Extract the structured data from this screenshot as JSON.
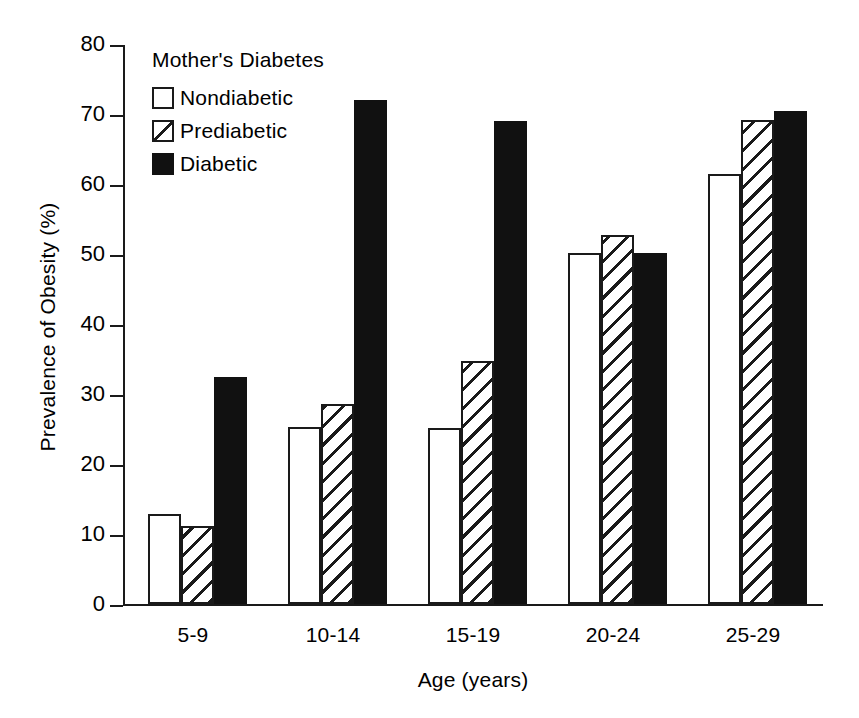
{
  "chart_data": {
    "type": "bar",
    "title": "",
    "subtitle": "",
    "xlabel": "Age (years)",
    "ylabel": "Prevalence of Obesity (%)",
    "categories": [
      "5-9",
      "10-14",
      "15-19",
      "20-24",
      "25-29"
    ],
    "series": [
      {
        "name": "Nondiabetic",
        "fill": "white-open",
        "values": [
          12.8,
          25.3,
          25.2,
          50.2,
          61.5
        ]
      },
      {
        "name": "Prediabetic",
        "fill": "diagonal-hatch",
        "values": [
          11.2,
          28.6,
          34.7,
          52.7,
          69.2
        ]
      },
      {
        "name": "Diabetic",
        "fill": "solid-black",
        "values": [
          32.4,
          72.0,
          69.0,
          50.2,
          70.5
        ]
      }
    ],
    "ylim": [
      0,
      80
    ],
    "yticks": [
      0,
      10,
      20,
      30,
      40,
      50,
      60,
      70,
      80
    ],
    "ytick_labels": [
      "0",
      "10",
      "20",
      "30",
      "40",
      "50",
      "60",
      "70",
      "80"
    ],
    "grid": false,
    "legend_position": "upper-left-inside",
    "colors": {
      "line": "#1a1a1a",
      "solid_fill": "#111111",
      "open_fill": "#ffffff",
      "background": "#ffffff"
    }
  },
  "legend": {
    "title": "Mother's Diabetes",
    "entries": [
      {
        "label": "Nondiabetic"
      },
      {
        "label": "Prediabetic"
      },
      {
        "label": "Diabetic"
      }
    ]
  }
}
